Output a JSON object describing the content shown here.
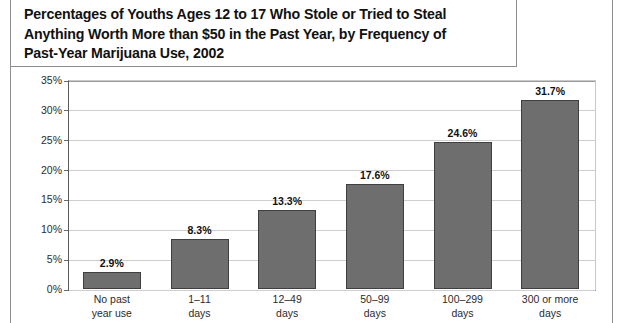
{
  "title": {
    "text": "Percentages of Youths Ages 12 to 17 Who Stole or Tried to Steal\nAnything Worth More than $50 in the Past Year, by Frequency of\nPast-Year Marijuana Use, 2002"
  },
  "colors": {
    "bar_fill": "#6e6e6e",
    "bar_stroke": "#3f3f3f",
    "gridline": "#cfcfcf",
    "axis": "#5a5a5a",
    "text": "#1a1a1a",
    "page_rule": "#8d8d8d"
  },
  "chart_data": {
    "type": "bar",
    "title": "Percentages of Youths Ages 12 to 17 Who Stole or Tried to Steal Anything Worth More than $50 in the Past Year, by Frequency of Past-Year Marijuana Use, 2002",
    "xlabel": "",
    "ylabel": "",
    "categories": [
      "No past\nyear use",
      "1–11\ndays",
      "12–49\ndays",
      "50–99\ndays",
      "100–299\ndays",
      "300 or more\ndays"
    ],
    "values": [
      2.9,
      8.3,
      13.3,
      17.6,
      24.6,
      31.7
    ],
    "data_labels": [
      "2.9%",
      "8.3%",
      "13.3%",
      "17.6%",
      "24.6%",
      "31.7%"
    ],
    "ylim": [
      0,
      35
    ],
    "ytick_values": [
      0,
      5,
      10,
      15,
      20,
      25,
      30,
      35
    ],
    "ytick_labels": [
      "0%",
      "5%",
      "10%",
      "15%",
      "20%",
      "25%",
      "30%",
      "35%"
    ],
    "grid": true,
    "legend": false
  }
}
